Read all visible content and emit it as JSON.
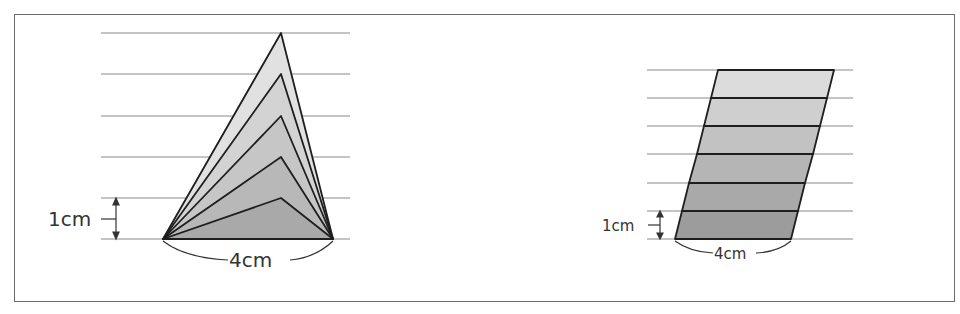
{
  "figures": {
    "left": {
      "name": "triangles-same-base",
      "height_label": "1cm",
      "base_label": "4cm",
      "guide_lines_y": [
        33,
        74,
        116,
        157,
        198,
        239
      ],
      "base": {
        "x1": 163,
        "x2": 333,
        "y": 239
      },
      "apex_x": 281,
      "apex_y": [
        198,
        157,
        116,
        74,
        33
      ],
      "fills": [
        "#a9a9a9",
        "#b8b8b8",
        "#c6c6c6",
        "#d3d3d3",
        "#e1e1e1"
      ]
    },
    "right": {
      "name": "parallelogram-stacked-strips",
      "height_label": "1cm",
      "base_label": "4cm",
      "guide_lines_y": [
        70,
        98,
        126,
        154,
        183,
        211,
        239
      ],
      "bottom": {
        "x1": 675,
        "x2": 791,
        "y": 239
      },
      "top": {
        "x1": 718,
        "x2": 834,
        "y": 70
      },
      "strip_fills": [
        "#9c9c9c",
        "#a9a9a9",
        "#b5b5b5",
        "#c2c2c2",
        "#cfcfcf",
        "#dcdcdc"
      ]
    }
  },
  "caption": {
    "text": "",
    "clipped": true
  },
  "colors": {
    "frame": "#6b6b6b",
    "guide_line": "#8a8a8a",
    "outline": "#1e1e1e"
  }
}
